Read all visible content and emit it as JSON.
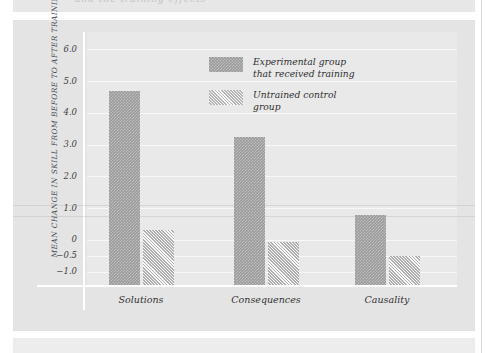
{
  "page": {
    "bleed_top_text": "and the training effects",
    "background_color": "#e4e4e4",
    "panel_color": "#e9e9e9"
  },
  "chart_data": {
    "type": "bar",
    "title": "",
    "xlabel": "",
    "ylabel": "MEAN CHANGE IN SKILL FROM BEFORE TO AFTER TRAINING",
    "categories": [
      "Solutions",
      "Consequences",
      "Causality"
    ],
    "series": [
      {
        "name": "Experimental group that received training",
        "values": [
          4.7,
          3.25,
          0.8
        ],
        "color": "#9b9b9b",
        "pattern": "checkerboard-hatch"
      },
      {
        "name": "Untrained control group",
        "values": [
          0.3,
          -0.05,
          -0.5
        ],
        "color": "#cdcdcd",
        "pattern": "diagonal-hatch"
      }
    ],
    "ytick_labels": [
      "6.0",
      "5.0",
      "4.0",
      "3.0",
      "2.0",
      "1.0",
      "0",
      "−0.5",
      "−1.0"
    ],
    "ytick_values": [
      6.0,
      5.0,
      4.0,
      3.0,
      2.0,
      1.0,
      0,
      -0.5,
      -1.0
    ],
    "ylim": [
      -1.45,
      6.55
    ],
    "grid": true,
    "legend_position": "top-center",
    "bar_baseline": "floor",
    "legend": [
      {
        "line1": "Experimental group",
        "line2": "that received training"
      },
      {
        "line1": "Untrained control",
        "line2": "group"
      }
    ]
  }
}
